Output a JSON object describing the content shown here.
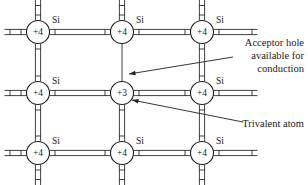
{
  "figure": {
    "background_color": "#ffffff",
    "line_color": "#2b2b2b",
    "text_color": "#1a1a1a",
    "width": 308,
    "height": 185
  },
  "lattice": {
    "columns_x": [
      38,
      122,
      202
    ],
    "rows_y": [
      32,
      93,
      153
    ],
    "atom_radius": 11.5,
    "atoms": [
      {
        "id": "atom-r0-c0",
        "charge": "+4",
        "element": "Si",
        "row": 0,
        "col": 0,
        "cx": 38,
        "cy": 32,
        "type": "silicon"
      },
      {
        "id": "atom-r0-c1",
        "charge": "+4",
        "element": "Si",
        "row": 0,
        "col": 1,
        "cx": 122,
        "cy": 32,
        "type": "silicon"
      },
      {
        "id": "atom-r0-c2",
        "charge": "+4",
        "element": "Si",
        "row": 0,
        "col": 2,
        "cx": 202,
        "cy": 32,
        "type": "silicon"
      },
      {
        "id": "atom-r1-c0",
        "charge": "+4",
        "element": "Si",
        "row": 1,
        "col": 0,
        "cx": 38,
        "cy": 93,
        "type": "silicon"
      },
      {
        "id": "atom-r1-c1",
        "charge": "+3",
        "element": "",
        "row": 1,
        "col": 1,
        "cx": 122,
        "cy": 93,
        "type": "trivalent"
      },
      {
        "id": "atom-r1-c2",
        "charge": "+4",
        "element": "Si",
        "row": 1,
        "col": 2,
        "cx": 202,
        "cy": 93,
        "type": "silicon"
      },
      {
        "id": "atom-r2-c0",
        "charge": "+4",
        "element": "Si",
        "row": 2,
        "col": 0,
        "cx": 38,
        "cy": 153,
        "type": "silicon"
      },
      {
        "id": "atom-r2-c1",
        "charge": "+4",
        "element": "Si",
        "row": 2,
        "col": 1,
        "cx": 122,
        "cy": 153,
        "type": "silicon"
      },
      {
        "id": "atom-r2-c2",
        "charge": "+4",
        "element": "Si",
        "row": 2,
        "col": 2,
        "cx": 202,
        "cy": 153,
        "type": "silicon"
      }
    ],
    "element_symbol": "Si",
    "charge_silicon": "+4",
    "charge_trivalent": "+3",
    "si_label_offset": {
      "dx": 14,
      "dy": -9
    },
    "broken_bond": {
      "description": "incomplete covalent bond drawn as a single line",
      "from": "atom-r0-c1",
      "to": "atom-r1-c1"
    }
  },
  "callouts": [
    {
      "id": "acceptor-hole-callout",
      "lines": [
        "Acceptor hole",
        "available for",
        "conduction"
      ],
      "text_x": 304,
      "text_y": 46,
      "line_height": 13,
      "anchor": "end",
      "arrow": {
        "x1": 233,
        "y1": 57,
        "x2": 129,
        "y2": 74
      }
    },
    {
      "id": "trivalent-atom-callout",
      "lines": [
        "Trivalent atom"
      ],
      "text_x": 304,
      "text_y": 127,
      "line_height": 13,
      "anchor": "end",
      "arrow": {
        "x1": 243,
        "y1": 122,
        "x2": 132,
        "y2": 100
      }
    }
  ]
}
